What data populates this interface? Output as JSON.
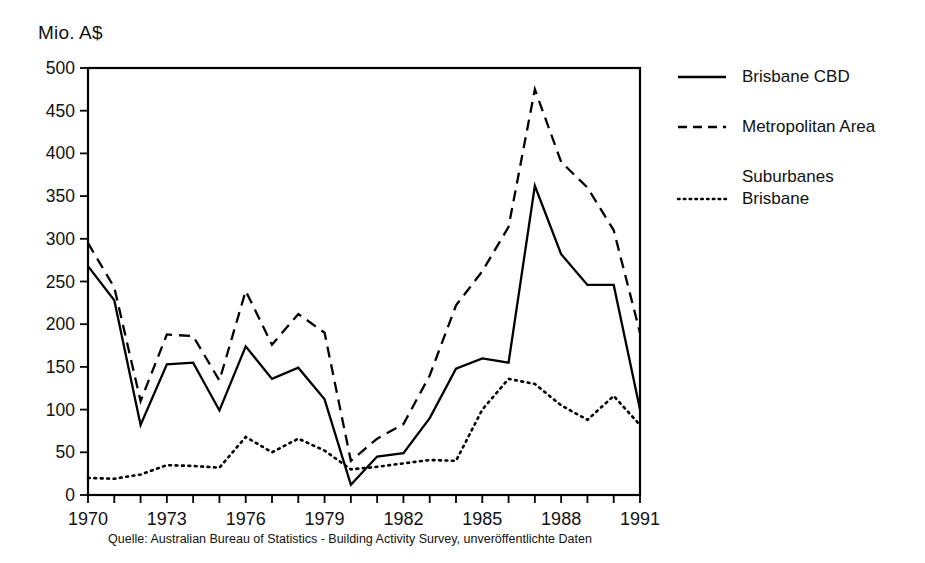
{
  "chart_data": {
    "type": "line",
    "title": "",
    "ylabel": "Mio. A$",
    "xlabel": "",
    "ylim": [
      0,
      500
    ],
    "ytick_step": 50,
    "yticks": [
      0,
      50,
      100,
      150,
      200,
      250,
      300,
      350,
      400,
      450,
      500
    ],
    "xlim": [
      1970,
      1991
    ],
    "xticks_all": [
      1970,
      1971,
      1972,
      1973,
      1974,
      1975,
      1976,
      1977,
      1978,
      1979,
      1980,
      1981,
      1982,
      1983,
      1984,
      1985,
      1986,
      1987,
      1988,
      1989,
      1990,
      1991
    ],
    "xtick_labels": [
      "1970",
      "1973",
      "1976",
      "1979",
      "1982",
      "1985",
      "1988",
      "1991"
    ],
    "xtick_labeled_values": [
      1970,
      1973,
      1976,
      1979,
      1982,
      1985,
      1988,
      1991
    ],
    "grid": false,
    "legend_position": "right",
    "x": [
      1970,
      1971,
      1972,
      1973,
      1974,
      1975,
      1976,
      1977,
      1978,
      1979,
      1980,
      1981,
      1982,
      1983,
      1984,
      1985,
      1986,
      1987,
      1988,
      1989,
      1990,
      1991
    ],
    "series": [
      {
        "name": "Brisbane CBD",
        "style": "solid",
        "color": "#000000",
        "values": [
          268,
          228,
          82,
          153,
          155,
          99,
          174,
          136,
          149,
          112,
          12,
          45,
          49,
          90,
          148,
          160,
          155,
          362,
          282,
          246,
          246,
          100
        ]
      },
      {
        "name": "Metropolitan Area",
        "style": "dashed",
        "color": "#000000",
        "values": [
          295,
          243,
          110,
          188,
          186,
          134,
          239,
          176,
          212,
          190,
          40,
          66,
          83,
          140,
          222,
          262,
          314,
          475,
          390,
          360,
          310,
          190
        ]
      },
      {
        "name": "Suburbanes Brisbane",
        "style": "dotted",
        "color": "#000000",
        "values": [
          20,
          19,
          24,
          35,
          34,
          32,
          68,
          50,
          66,
          52,
          30,
          33,
          37,
          41,
          40,
          100,
          136,
          130,
          105,
          88,
          116,
          82
        ]
      }
    ]
  },
  "legend": {
    "items": [
      {
        "label": "Brisbane CBD",
        "style": "solid"
      },
      {
        "label": "Metropolitan Area",
        "style": "dashed"
      },
      {
        "label": "Suburbanes\nBrisbane",
        "style": "dotted"
      }
    ]
  },
  "source": {
    "text": "Quelle: Australian Bureau of Statistics - Building Activity Survey, unveröffentlichte Daten"
  }
}
